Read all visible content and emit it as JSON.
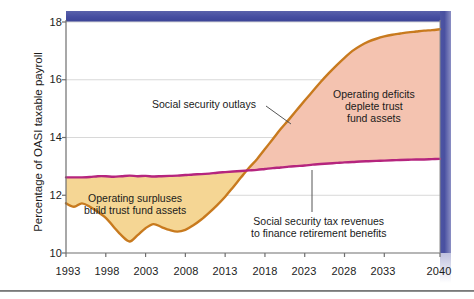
{
  "chart_data": {
    "type": "area",
    "title": "",
    "xlabel": "",
    "ylabel": "Percentage of OASI taxable payroll",
    "xlim": [
      1993,
      2040
    ],
    "ylim": [
      10,
      18
    ],
    "yticks": [
      "10",
      "12",
      "14",
      "16",
      "18"
    ],
    "ytick_values": [
      10,
      12,
      14,
      16,
      18
    ],
    "xticks": [
      "1993",
      "1998",
      "2003",
      "2008",
      "2013",
      "2018",
      "2023",
      "2028",
      "2033",
      "2040"
    ],
    "xtick_values": [
      1993,
      1998,
      2003,
      2008,
      2013,
      2018,
      2023,
      2028,
      2033,
      2040
    ],
    "grid": "horizontal",
    "legend": "none",
    "series": [
      {
        "name": "Social security outlays",
        "color": "#C87A1E",
        "x": [
          1993,
          1994,
          1995,
          1996,
          1997,
          1998,
          1999,
          2000,
          2001,
          2002,
          2003,
          2004,
          2005,
          2006,
          2007,
          2008,
          2009,
          2010,
          2011,
          2012,
          2013,
          2014,
          2015,
          2016,
          2017,
          2018,
          2019,
          2020,
          2021,
          2022,
          2023,
          2024,
          2025,
          2026,
          2027,
          2028,
          2029,
          2030,
          2031,
          2032,
          2033,
          2034,
          2035,
          2036,
          2037,
          2038,
          2039,
          2040
        ],
        "values": [
          11.72,
          11.6,
          11.72,
          11.6,
          11.42,
          11.22,
          10.9,
          10.6,
          10.4,
          10.62,
          10.86,
          11.0,
          10.9,
          10.8,
          10.74,
          10.8,
          10.96,
          11.16,
          11.4,
          11.66,
          11.95,
          12.28,
          12.62,
          12.95,
          13.25,
          13.6,
          13.95,
          14.3,
          14.62,
          14.95,
          15.28,
          15.6,
          15.92,
          16.22,
          16.5,
          16.76,
          17.0,
          17.18,
          17.32,
          17.42,
          17.5,
          17.56,
          17.6,
          17.64,
          17.67,
          17.7,
          17.72,
          17.75
        ]
      },
      {
        "name": "Social security tax revenues to finance retirement benefits",
        "color": "#B5257E",
        "x": [
          1993,
          1994,
          1995,
          1996,
          1997,
          1998,
          1999,
          2000,
          2001,
          2002,
          2003,
          2004,
          2005,
          2006,
          2007,
          2008,
          2009,
          2010,
          2011,
          2012,
          2013,
          2014,
          2015,
          2016,
          2017,
          2018,
          2019,
          2020,
          2021,
          2022,
          2023,
          2024,
          2025,
          2026,
          2027,
          2028,
          2029,
          2030,
          2031,
          2032,
          2033,
          2034,
          2035,
          2036,
          2037,
          2038,
          2039,
          2040
        ],
        "values": [
          12.62,
          12.62,
          12.62,
          12.63,
          12.66,
          12.66,
          12.64,
          12.66,
          12.68,
          12.66,
          12.67,
          12.65,
          12.66,
          12.67,
          12.68,
          12.7,
          12.72,
          12.73,
          12.75,
          12.78,
          12.8,
          12.82,
          12.84,
          12.86,
          12.88,
          12.91,
          12.94,
          12.96,
          12.99,
          13.01,
          13.03,
          13.06,
          13.08,
          13.1,
          13.12,
          13.14,
          13.15,
          13.17,
          13.18,
          13.19,
          13.2,
          13.21,
          13.22,
          13.23,
          13.24,
          13.24,
          13.25,
          13.26
        ]
      }
    ],
    "fills": [
      {
        "name": "Operating surpluses build trust fund assets",
        "color": "#F5D694",
        "between": [
          "Social security tax revenues to finance retirement benefits",
          "Social security outlays"
        ],
        "range": [
          1993,
          2017
        ]
      },
      {
        "name": "Operating deficits deplete trust fund assets",
        "color": "#F4C3B0",
        "between": [
          "Social security outlays",
          "Social security tax revenues to finance retirement benefits"
        ],
        "range": [
          2017,
          2040
        ]
      }
    ],
    "annotations": [
      {
        "id": "outlays",
        "text": "Social security outlays",
        "lines": [
          "Social security outlays"
        ]
      },
      {
        "id": "deficits",
        "text": "Operating deficits deplete trust fund assets",
        "lines": [
          "Operating deficits",
          "deplete trust",
          "fund assets"
        ]
      },
      {
        "id": "surpluses",
        "text": "Operating surpluses build trust fund assets",
        "lines": [
          "Operating surpluses",
          "build trust fund assets"
        ]
      },
      {
        "id": "revenues",
        "text": "Social security tax revenues to finance retirement benefits",
        "lines": [
          "Social security tax revenues",
          "to finance retirement benefits"
        ]
      }
    ]
  },
  "colors": {
    "outlays_line": "#C87A1E",
    "revenue_line": "#B5257E",
    "surplus_fill": "#F5D694",
    "deficit_fill": "#F4C3B0",
    "frame_blue": "#4A52A1",
    "axis": "#6e6e6e",
    "grid": "#d8d8d8",
    "text": "#1c1c1c"
  },
  "axis": {
    "y_title": "Percentage of OASI taxable payroll",
    "y_ticks": [
      {
        "label": "18",
        "value": 18
      },
      {
        "label": "16",
        "value": 16
      },
      {
        "label": "14",
        "value": 14
      },
      {
        "label": "12",
        "value": 12
      },
      {
        "label": "10",
        "value": 10
      }
    ],
    "x_ticks": [
      {
        "label": "1993",
        "value": 1993
      },
      {
        "label": "1998",
        "value": 1998
      },
      {
        "label": "2003",
        "value": 2003
      },
      {
        "label": "2008",
        "value": 2008
      },
      {
        "label": "2013",
        "value": 2013
      },
      {
        "label": "2018",
        "value": 2018
      },
      {
        "label": "2023",
        "value": 2023
      },
      {
        "label": "2028",
        "value": 2028
      },
      {
        "label": "2033",
        "value": 2033
      },
      {
        "label": "2040",
        "value": 2040
      }
    ]
  },
  "annotations": {
    "outlays": "Social security outlays",
    "deficits_l1": "Operating deficits",
    "deficits_l2": "deplete trust",
    "deficits_l3": "fund assets",
    "surpluses_l1": "Operating surpluses",
    "surpluses_l2": "build trust fund assets",
    "revenues_l1": "Social security tax revenues",
    "revenues_l2": "to finance retirement benefits"
  }
}
